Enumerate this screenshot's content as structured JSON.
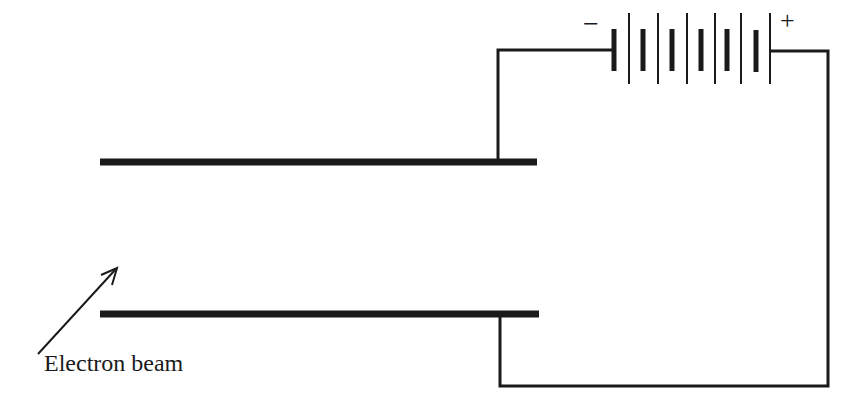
{
  "diagram": {
    "labels": {
      "beam": "Electron beam",
      "negative": "−",
      "positive": "+"
    },
    "colors": {
      "ink": "#1a1a1a",
      "background": "#ffffff"
    },
    "components": [
      {
        "type": "plate",
        "name": "upper-plate",
        "polarity": "negative"
      },
      {
        "type": "plate",
        "name": "lower-plate",
        "polarity": "positive"
      },
      {
        "type": "battery",
        "cells": 6
      },
      {
        "type": "arrow",
        "name": "electron-beam-arrow"
      }
    ]
  }
}
